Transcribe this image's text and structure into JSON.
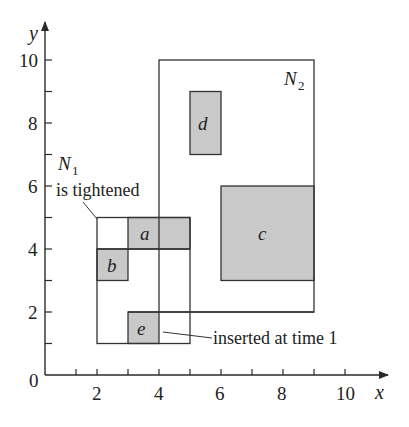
{
  "diagram": {
    "type": "R-tree spatial rectangles",
    "axes": {
      "x_label": "x",
      "y_label": "y",
      "origin_label": "0",
      "x_tick_labels": [
        "2",
        "4",
        "6",
        "8",
        "10"
      ],
      "y_tick_labels": [
        "2",
        "4",
        "6",
        "8",
        "10"
      ],
      "x_range": [
        0,
        10
      ],
      "y_range": [
        0,
        10
      ]
    },
    "nodes": [
      {
        "id": "N1",
        "letter": "N",
        "subscript": "1",
        "x1": 2,
        "y1": 1,
        "x2": 5,
        "y2": 5
      },
      {
        "id": "N2",
        "letter": "N",
        "subscript": "2",
        "x1": 4,
        "y1": 2,
        "x2": 9,
        "y2": 10
      }
    ],
    "rectangles": [
      {
        "label": "a",
        "x1": 3,
        "y1": 4,
        "x2": 5,
        "y2": 5
      },
      {
        "label": "b",
        "x1": 2,
        "y1": 3,
        "x2": 3,
        "y2": 4
      },
      {
        "label": "c",
        "x1": 6,
        "y1": 3,
        "x2": 9,
        "y2": 6
      },
      {
        "label": "d",
        "x1": 5,
        "y1": 7,
        "x2": 6,
        "y2": 9
      },
      {
        "label": "e",
        "x1": 3,
        "y1": 1,
        "x2": 4,
        "y2": 2
      }
    ],
    "annotations": {
      "n1_note": "is tightened",
      "e_note": "inserted at time 1"
    },
    "colors": {
      "shade": "#c9c9c9",
      "line": "#333333"
    }
  }
}
